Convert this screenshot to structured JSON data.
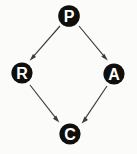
{
  "diagram": {
    "type": "directed-graph",
    "canvas": {
      "width": 137,
      "height": 154,
      "background": "#fbfbfa"
    },
    "style": {
      "node_fill": "#100f0d",
      "node_label_color": "#ffffff",
      "edge_color": "#3b3b3b",
      "node_radius": 10.6,
      "edge_width": 1.15
    },
    "nodes": [
      {
        "id": "P",
        "label": "P",
        "cx": 69,
        "cy": 16,
        "r": 10.8,
        "position": "top"
      },
      {
        "id": "R",
        "label": "R",
        "cx": 22,
        "cy": 73,
        "r": 10.6,
        "position": "left"
      },
      {
        "id": "A",
        "label": "A",
        "cx": 114,
        "cy": 74,
        "r": 10.6,
        "position": "right"
      },
      {
        "id": "C",
        "label": "C",
        "cx": 70,
        "cy": 134,
        "r": 10.6,
        "position": "bottom"
      }
    ],
    "edges": [
      {
        "id": "P-R",
        "from": "P",
        "to": "R",
        "x1": 60,
        "y1": 26,
        "x2": 31,
        "y2": 59,
        "directed": true
      },
      {
        "id": "P-A",
        "from": "P",
        "to": "A",
        "x1": 79,
        "y1": 26,
        "x2": 107,
        "y2": 59,
        "directed": true
      },
      {
        "id": "R-C",
        "from": "R",
        "to": "C",
        "x1": 30,
        "y1": 85,
        "x2": 59,
        "y2": 122,
        "directed": true
      },
      {
        "id": "A-C",
        "from": "A",
        "to": "C",
        "x1": 107,
        "y1": 86,
        "x2": 82,
        "y2": 123,
        "directed": true
      }
    ]
  }
}
